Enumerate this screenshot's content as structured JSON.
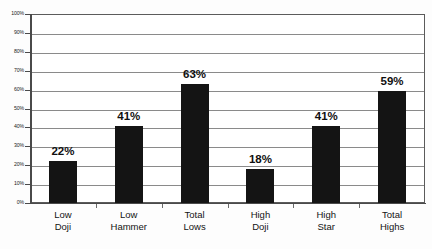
{
  "chart_data": {
    "type": "bar",
    "title": "",
    "subtitle": "",
    "xlabel": "",
    "ylabel": "",
    "ylim": [
      0,
      100
    ],
    "grid": true,
    "legend": false,
    "value_suffix": "%",
    "categories": [
      {
        "line1": "Low",
        "line2": "Doji"
      },
      {
        "line1": "Low",
        "line2": "Hammer"
      },
      {
        "line1": "Total",
        "line2": "Lows"
      },
      {
        "line1": "High",
        "line2": "Doji"
      },
      {
        "line1": "High",
        "line2": "Star"
      },
      {
        "line1": "Total",
        "line2": "Highs"
      }
    ],
    "values": [
      22,
      41,
      63,
      18,
      41,
      59
    ],
    "value_labels": [
      "22%",
      "41%",
      "63%",
      "18%",
      "41%",
      "59%"
    ],
    "y_ticks": [
      "100%",
      "90%",
      "80%",
      "70%",
      "60%",
      "50%",
      "40%",
      "30%",
      "20%",
      "10%",
      "0%"
    ],
    "y_tick_values": [
      100,
      90,
      80,
      70,
      60,
      50,
      40,
      30,
      20,
      10,
      0
    ],
    "colors": {
      "bar": "#141414",
      "gridline": "#8a8a8a",
      "axis": "#4a4a4a",
      "frame": "#5b5b5b",
      "text": "#141414",
      "background": "#ffffff"
    }
  }
}
